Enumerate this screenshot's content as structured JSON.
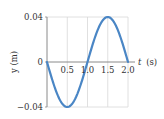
{
  "chart_data": {
    "type": "line",
    "title": "",
    "xlabel_var": "t",
    "xlabel_unit": "(s)",
    "xlabel": "t (s)",
    "ylabel": "y (m)",
    "xlim": [
      0,
      2.0
    ],
    "ylim": [
      -0.04,
      0.04
    ],
    "grid": true,
    "legend": null,
    "x_ticks": [
      0.5,
      1.0,
      1.5,
      2.0
    ],
    "x_tick_labels": [
      "0.5",
      "1.0",
      "1.5",
      "2.0"
    ],
    "y_ticks": [
      0.04,
      0,
      -0.04
    ],
    "y_tick_labels": [
      "0.04",
      "0",
      "−0.04"
    ],
    "series": [
      {
        "name": "y(t)",
        "color": "#4a86c5",
        "function": "y = -0.04 sin(π t)",
        "x": [
          0,
          0.25,
          0.5,
          0.75,
          1.0,
          1.25,
          1.5,
          1.75,
          2.0
        ],
        "values": [
          0,
          -0.0283,
          -0.04,
          -0.0283,
          0,
          0.0283,
          0.04,
          0.0283,
          0
        ]
      }
    ]
  },
  "colors": {
    "curve": "#4a86c5",
    "axis": "#8a8a8a",
    "grid": "#d8d8d8",
    "text": "#333333"
  }
}
